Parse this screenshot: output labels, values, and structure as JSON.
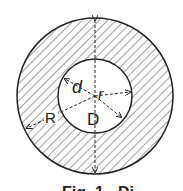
{
  "diagram": {
    "type": "annular-section",
    "labels": {
      "inner_diameter": "d",
      "inner_radius": "r",
      "outer_radius": "R",
      "outer_diameter": "D"
    },
    "caption": "Fig. 1 - Di"
  },
  "colors": {
    "stroke": "#222222",
    "background": "#ffffff"
  }
}
